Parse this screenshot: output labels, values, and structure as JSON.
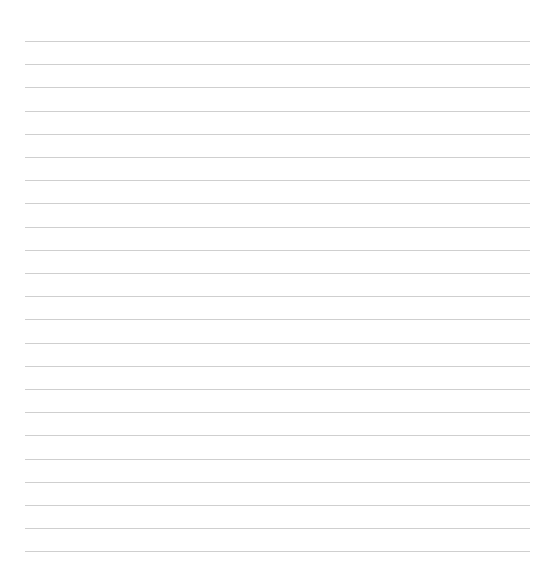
{
  "page": {
    "type": "ruled-sheet",
    "background_color": "#ffffff",
    "line_color": "#cfcfcf",
    "line_count": 23,
    "first_line_y": 41,
    "line_spacing": 23.2,
    "line_left": 25,
    "line_right": 530
  }
}
